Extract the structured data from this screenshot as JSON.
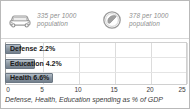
{
  "stats": [
    {
      "icon": "car-icon",
      "value_line": "335 per 1000",
      "unit_line": "population"
    },
    {
      "icon": "telephone-icon",
      "value_line": "378 per 1000",
      "unit_line": "population"
    }
  ],
  "caption": "Defense, Health, Education spending as % of GDP",
  "colors": {
    "bar": "#8e9aa6",
    "bar_border": "#6c7884",
    "grid": "#dcdcdc",
    "frame": "#b9b9b9",
    "stat_text": "#8e8e8e"
  },
  "chart_data": {
    "type": "bar",
    "orientation": "horizontal",
    "title": "",
    "categories": [
      "Defense",
      "Education",
      "Health"
    ],
    "values": [
      2.2,
      4.2,
      6.6
    ],
    "bar_labels": [
      "Defense 2.2%",
      "Education 4.2%",
      "Health 6.6%"
    ],
    "xlabel": "",
    "ylabel": "",
    "xlim": [
      0,
      25
    ],
    "xticks": [
      0,
      5,
      10,
      15,
      20,
      25
    ],
    "xtick_labels": [
      "0",
      "5",
      "10",
      "15",
      "20",
      "25"
    ],
    "grid": true,
    "legend": false,
    "caption": "Defense, Health, Education spending as % of GDP"
  }
}
